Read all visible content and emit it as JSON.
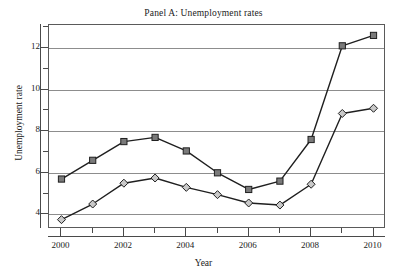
{
  "chart_data": {
    "type": "line",
    "title": "Panel A: Unemployment rates",
    "xlabel": "Year",
    "ylabel": "Unemployment rate",
    "x": [
      2000,
      2001,
      2002,
      2003,
      2004,
      2005,
      2006,
      2007,
      2008,
      2009,
      2010
    ],
    "xlim": [
      1999.6,
      2010.4
    ],
    "ylim": [
      3.3,
      13.1
    ],
    "xticks": [
      2000,
      2001,
      2002,
      2003,
      2004,
      2005,
      2006,
      2007,
      2008,
      2009,
      2010
    ],
    "xtick_labels": [
      "2000",
      "",
      "2002",
      "",
      "2004",
      "",
      "2006",
      "",
      "2008",
      "",
      "2010"
    ],
    "yticks": [
      4,
      5,
      6,
      7,
      8,
      9,
      10,
      11,
      12,
      13
    ],
    "ytick_labels": [
      "4",
      "",
      "6",
      "",
      "8",
      "",
      "10",
      "",
      "12",
      ""
    ],
    "gridlines_y": [
      4,
      6,
      8,
      10,
      12
    ],
    "grid": "horizontal",
    "legend": "none",
    "series": [
      {
        "name": "series-squares",
        "marker": "square",
        "marker_fill": "#7a7a7a",
        "marker_edge": "#1f1f1f",
        "line_color": "#1f1f1f",
        "values": [
          5.7,
          6.6,
          7.5,
          7.7,
          7.05,
          6.0,
          5.2,
          5.6,
          7.6,
          12.1,
          12.6
        ]
      },
      {
        "name": "series-diamonds",
        "marker": "diamond",
        "marker_fill": "#c9c9c9",
        "marker_edge": "#1f1f1f",
        "line_color": "#1f1f1f",
        "values": [
          3.75,
          4.5,
          5.5,
          5.75,
          5.3,
          4.95,
          4.55,
          4.45,
          5.45,
          8.85,
          9.1
        ]
      }
    ]
  },
  "colors": {
    "background": "#ffffff",
    "frame": "#5a5a5a",
    "gridline": "#8d8d8d",
    "axis": "#4a4a4a",
    "text": "#222222"
  }
}
